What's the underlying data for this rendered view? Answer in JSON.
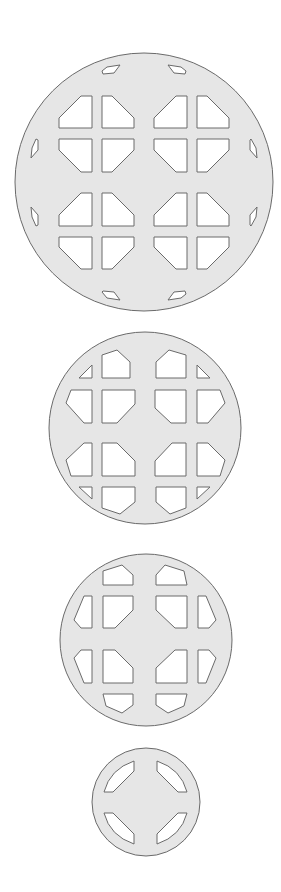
{
  "figure": {
    "background": "#ffffff",
    "plate_fill": "#e6e6e6",
    "outline_color": "#6a6a6a",
    "hole_fill": "#ffffff"
  },
  "plates": [
    {
      "name": "plate-1",
      "cx": 144,
      "cy": 182,
      "r": 129,
      "pattern": "4 groups of 4 chamfered square windows plus 8 small peripheral slots"
    },
    {
      "name": "plate-2",
      "cx": 145,
      "cy": 428,
      "r": 96,
      "pattern": "4x4 grid of chamfered windows clipped to circle"
    },
    {
      "name": "plate-3",
      "cx": 146,
      "cy": 640,
      "r": 86,
      "pattern": "12 windows around central cross"
    },
    {
      "name": "plate-4",
      "cx": 146,
      "cy": 802,
      "r": 54,
      "pattern": "4 diagonal slots around central cross"
    }
  ]
}
